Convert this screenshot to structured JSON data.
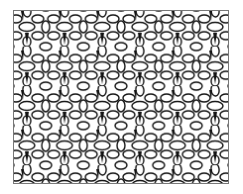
{
  "image": {
    "description": "Black and white tessellated floral/cell pattern within a rectangular frame",
    "colors": {
      "stroke": "#111111",
      "fill": "#ffffff",
      "frame": "#777777",
      "background": "#ffffff"
    },
    "pattern": {
      "tile_width": 38,
      "tile_height": 40,
      "columns": 5.7,
      "rows": 4.35
    }
  }
}
